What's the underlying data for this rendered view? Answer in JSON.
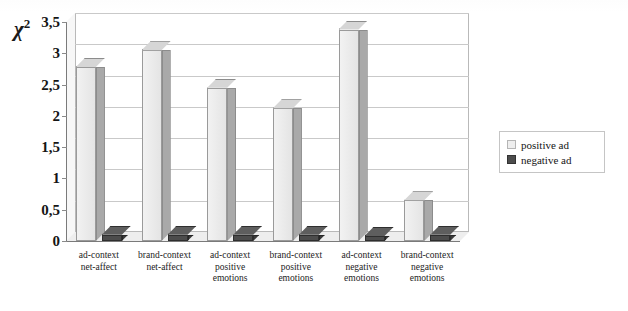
{
  "chart_data": {
    "type": "bar",
    "title": "",
    "subtitle": "",
    "xlabel": "",
    "ylabel": "χ²",
    "ylabel_base": "χ",
    "ylabel_sup": "2",
    "ylim": [
      0,
      3.5
    ],
    "yticks": [
      0,
      0.5,
      1,
      1.5,
      2,
      2.5,
      3,
      3.5
    ],
    "ytick_labels": [
      "0",
      "0,5",
      "1",
      "1,5",
      "2",
      "2,5",
      "3",
      "3,5"
    ],
    "grid": true,
    "grid_axis": "y",
    "legend_position": "right",
    "three_d": true,
    "decimal_separator": ",",
    "categories": [
      "ad-context net-affect",
      "brand-context net-affect",
      "ad-context positive emotions",
      "brand-context positive emotions",
      "ad-context negative emotions",
      "brand-context negative emotions"
    ],
    "category_lines": [
      [
        "ad-context",
        "net-affect"
      ],
      [
        "brand-context",
        "net-affect"
      ],
      [
        "ad-context",
        "positive",
        "emotions"
      ],
      [
        "brand-context",
        "positive",
        "emotions"
      ],
      [
        "ad-context",
        "negative",
        "emotions"
      ],
      [
        "brand-context",
        "negative",
        "emotions"
      ]
    ],
    "series": [
      {
        "name": "positive ad",
        "color": "#e8e8e8",
        "values": [
          2.78,
          3.05,
          2.45,
          2.12,
          3.38,
          0.65
        ]
      },
      {
        "name": "negative ad",
        "color": "#4c4c4c",
        "values": [
          0.1,
          0.1,
          0.1,
          0.1,
          0.08,
          0.1
        ]
      }
    ]
  },
  "legend": {
    "items": [
      {
        "label": "positive ad",
        "swatch": "light"
      },
      {
        "label": "negative ad",
        "swatch": "dark"
      }
    ]
  }
}
